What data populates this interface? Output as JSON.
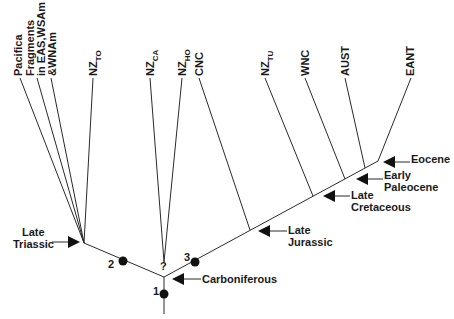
{
  "diagram": {
    "type": "cladogram",
    "colors": {
      "line": "#2a2a2a",
      "text": "#1a1a1a",
      "dot": "#111111"
    },
    "taxa": [
      {
        "id": "pacifica",
        "lines": [
          "Pacifica"
        ]
      },
      {
        "id": "fragments",
        "lines": [
          "Fragments",
          "in EAS,WSAm",
          "&WNAm"
        ]
      },
      {
        "id": "nz_to",
        "main": "NZ",
        "sub": "TO"
      },
      {
        "id": "nz_ca",
        "main": "NZ",
        "sub": "CA"
      },
      {
        "id": "nz_ho",
        "main": "NZ",
        "sub": "HO"
      },
      {
        "id": "cnc",
        "main": "CNC"
      },
      {
        "id": "nz_tu",
        "main": "NZ",
        "sub": "TU"
      },
      {
        "id": "wnc",
        "main": "WNC"
      },
      {
        "id": "aust",
        "main": "AUST"
      },
      {
        "id": "eant",
        "main": "EANT"
      }
    ],
    "time_labels": {
      "late_triassic": [
        "Late",
        "Triassic"
      ],
      "carboniferous": "Carboniferous",
      "late_jurassic": [
        "Late",
        "Jurassic"
      ],
      "late_cretaceous": [
        "Late",
        "Cretaceous"
      ],
      "early_paleocene": [
        "Early",
        "Paleocene"
      ],
      "eocene": "Eocene"
    },
    "node_markers": [
      {
        "label": "1"
      },
      {
        "label": "2"
      },
      {
        "label": "3"
      },
      {
        "label": "?"
      }
    ]
  }
}
